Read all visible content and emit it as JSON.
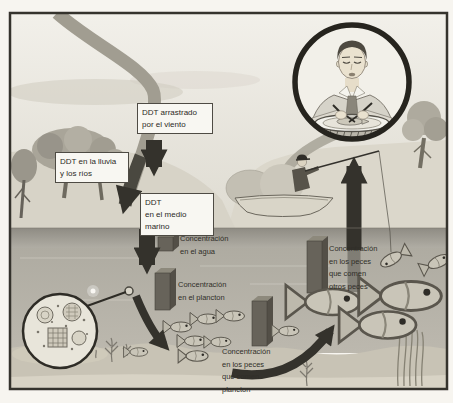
{
  "colors": {
    "frame": "#35332d",
    "paper": "#f7f5f0",
    "sky": "#efede6",
    "land": "#d9d5c9",
    "water": "#b2afa6",
    "sea_floor": "#c8c3b5",
    "arrow": "#34322c",
    "box_background": "#f8f7f2",
    "box_border": "#4e4b44",
    "bar": "#67635a",
    "fish": "#c9c5b8"
  },
  "boxes": {
    "wind": {
      "lines": [
        "DDT arrastrado",
        "por el viento"
      ]
    },
    "rain": {
      "lines": [
        "DDT en la lluvia",
        "y los ríos"
      ]
    },
    "marine": {
      "lines": [
        "DDT",
        "en el medio",
        "marino"
      ]
    }
  },
  "labels": {
    "water": {
      "lines": [
        "Concentración",
        "en el agua"
      ]
    },
    "plankton": {
      "lines": [
        "Concentración",
        "en el plancton"
      ]
    },
    "fish_plankton": {
      "lines": [
        "Concentración",
        "en los peces",
        "que comen",
        "plancton"
      ]
    },
    "fish_fish": {
      "lines": [
        "Concentración",
        "en los peces",
        "que comen",
        "otros peces"
      ]
    }
  },
  "concentration_bars": [
    {
      "name": "en el agua",
      "relative_height_px": 14
    },
    {
      "name": "en el plancton",
      "relative_height_px": 37
    },
    {
      "name": "en los peces que comen plancton",
      "relative_height_px": 45
    },
    {
      "name": "en los peces que comen otros peces",
      "relative_height_px": 52
    }
  ],
  "scene": {
    "illustrations": [
      "river-into-sea-arrow",
      "wind-deposition-arrow",
      "marine-ddt-arrow",
      "plankton-magnifier",
      "plankton-to-fish-arrow",
      "small-fish-school",
      "fish-to-fish-arrow",
      "large-fish-group",
      "fisherman-in-boat",
      "hooked-fish",
      "fish-to-human-arrow",
      "man-eating-fish"
    ]
  }
}
